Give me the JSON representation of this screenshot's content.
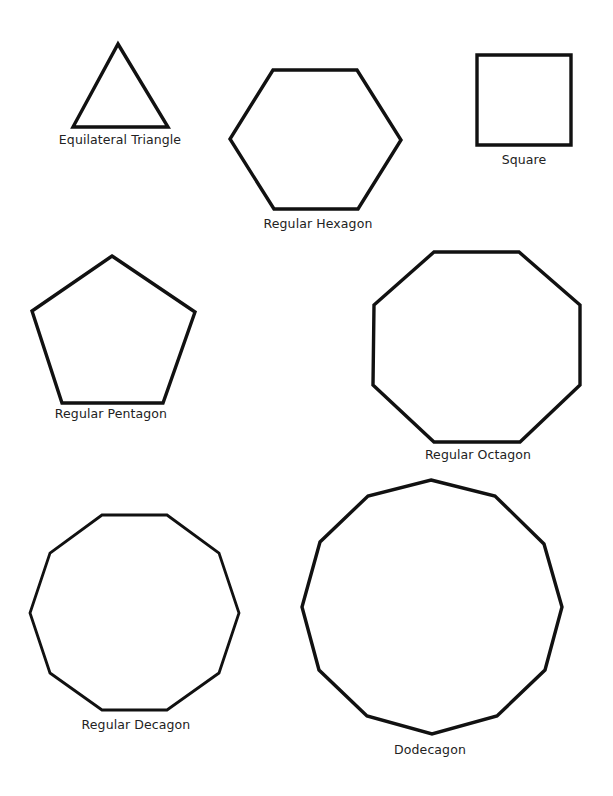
{
  "diagram": {
    "stroke_color": "#111111",
    "label_color": "#222222",
    "background": "#ffffff",
    "shapes": [
      {
        "id": "triangle",
        "label": "Equilateral Triangle",
        "sides": 3,
        "points": "118,44 168,127 73,127",
        "label_x": 120,
        "label_y": 134
      },
      {
        "id": "hexagon",
        "label": "Regular Hexagon",
        "sides": 6,
        "points": "273,70 357,70 401,140 358,209 274,209 230,139",
        "label_x": 318,
        "label_y": 218
      },
      {
        "id": "square",
        "label": "Square",
        "sides": 4,
        "points": "477,55 571,55 571,145 477,145",
        "label_x": 524,
        "label_y": 154
      },
      {
        "id": "pentagon",
        "label": "Regular Pentagon",
        "sides": 5,
        "points": "112,256 195,312 163,403 62,403 32,311",
        "label_x": 111,
        "label_y": 408
      },
      {
        "id": "octagon",
        "label": "Regular Octagon",
        "sides": 8,
        "points": "434,252 519,252 580,305 580,385 520,442 434,442 373,385 374,305",
        "label_x": 478,
        "label_y": 449
      },
      {
        "id": "decagon",
        "label": "Regular Decagon",
        "sides": 10,
        "points": "102,515 167,515 219,553 239,613 219,673 167,710 102,710 50,673 30,613 50,553",
        "label_x": 136,
        "label_y": 719
      },
      {
        "id": "dodecagon",
        "label": "Dodecagon",
        "sides": 12,
        "points": "431,480 495,496 544,544 562,607 545,670 497,716 432,734 367,716 319,670 302,607 320,542 368,496",
        "label_x": 430,
        "label_y": 744
      }
    ]
  }
}
